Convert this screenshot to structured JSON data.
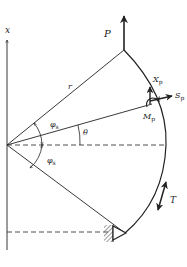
{
  "diagram": {
    "type": "mechanics-free-body-diagram",
    "colors": {
      "line": "#222222",
      "background": "#ffffff",
      "hatch": "#555555"
    },
    "labels": {
      "x_axis": "x",
      "load_P": "P",
      "radius": "r",
      "X_p": "X",
      "X_p_sub": "p",
      "S_p": "S",
      "S_p_sub": "p",
      "M_p": "M",
      "M_p_sub": "p",
      "phi_upper": "φ",
      "phi_upper_sub": "s",
      "phi_lower": "φ",
      "phi_lower_sub": "s",
      "theta": "θ",
      "tension_T": "T"
    }
  }
}
